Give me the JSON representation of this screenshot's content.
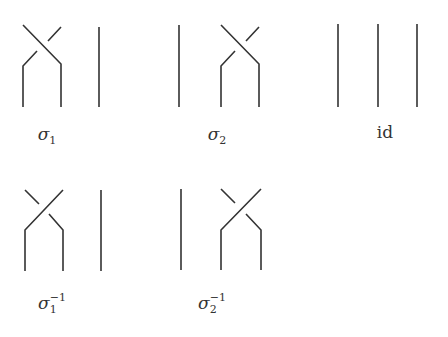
{
  "diagram": {
    "stroke_color": "#333333",
    "background": "#ffffff",
    "braids": [
      {
        "id": "sigma1",
        "label": {
          "symbol": "σ",
          "sub": "1",
          "sup": "",
          "x": 47,
          "y": 124
        },
        "strands": [
          {
            "type": "over",
            "d": "M23 25 L61 64 L61 107"
          },
          {
            "type": "under",
            "d": "M61 27 L48 41 M37 51 L23 66 L23 107"
          },
          {
            "type": "straight",
            "d": "M99 27 L99 107"
          }
        ]
      },
      {
        "id": "sigma2",
        "label": {
          "symbol": "σ",
          "sub": "2",
          "sup": "",
          "x": 217,
          "y": 124
        },
        "strands": [
          {
            "type": "straight",
            "d": "M179 25 L179 107"
          },
          {
            "type": "over",
            "d": "M221 25 L259 64 L259 107"
          },
          {
            "type": "under",
            "d": "M259 27 L246 41 M235 51 L221 66 L221 107"
          }
        ]
      },
      {
        "id": "identity",
        "label": {
          "symbol": "id",
          "sub": "",
          "sup": "",
          "x": 385,
          "y": 122,
          "upright": true
        },
        "strands": [
          {
            "type": "straight",
            "d": "M338 24 L338 107"
          },
          {
            "type": "straight",
            "d": "M378 24 L378 107"
          },
          {
            "type": "straight",
            "d": "M417 24 L417 107"
          }
        ]
      },
      {
        "id": "sigma1-inverse",
        "label": {
          "symbol": "σ",
          "sub": "1",
          "sup": "−1",
          "x": 51,
          "y": 288
        },
        "strands": [
          {
            "type": "over",
            "d": "M63 190 L25 230 L25 271"
          },
          {
            "type": "under",
            "d": "M25 190 L39 204 M49 214 L63 230 L63 271"
          },
          {
            "type": "straight",
            "d": "M101 190 L101 271"
          }
        ]
      },
      {
        "id": "sigma2-inverse",
        "label": {
          "symbol": "σ",
          "sub": "2",
          "sup": "−1",
          "x": 211,
          "y": 288
        },
        "strands": [
          {
            "type": "straight",
            "d": "M181 189 L181 270"
          },
          {
            "type": "over",
            "d": "M261 189 L221 230 L221 270"
          },
          {
            "type": "under",
            "d": "M221 189 L235 203 M246 214 L261 230 L261 270"
          }
        ]
      }
    ]
  }
}
